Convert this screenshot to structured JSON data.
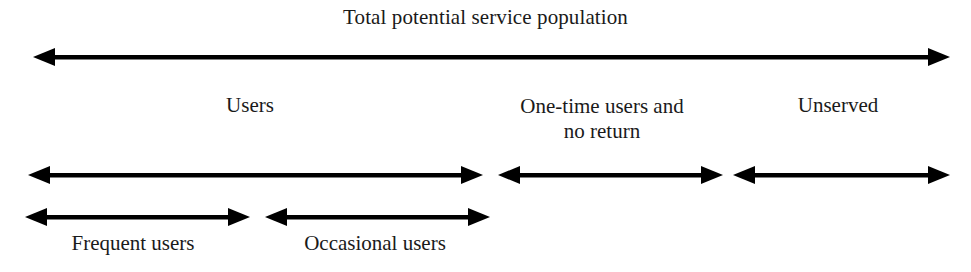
{
  "diagram": {
    "title": "Total potential service population",
    "background_color": "#ffffff",
    "stroke_color": "#000000",
    "text_color": "#1a1a1a",
    "total_arrow": {
      "label": "Total potential service population",
      "x_start": 33,
      "x_end": 950,
      "y": 57
    },
    "segments": [
      {
        "label": "Users",
        "x_start": 28,
        "x_end": 483,
        "y": 175,
        "label_x_center": 250,
        "label_y": 95,
        "lines": [
          "Users"
        ]
      },
      {
        "label": "One-time users and no return",
        "x_start": 498,
        "x_end": 723,
        "y": 175,
        "label_x_center": 602,
        "label_y": 95,
        "lines": [
          "One-time users and",
          "no return"
        ]
      },
      {
        "label": "Unserved",
        "x_start": 733,
        "x_end": 950,
        "y": 175,
        "label_x_center": 838,
        "label_y": 95,
        "lines": [
          "Unserved"
        ]
      }
    ],
    "subsegments": [
      {
        "label": "Frequent users",
        "x_start": 25,
        "x_end": 250,
        "y": 217,
        "label_x_center": 133,
        "label_y": 234
      },
      {
        "label": "Occasional users",
        "x_start": 265,
        "x_end": 490,
        "y": 217,
        "label_x_center": 375,
        "label_y": 234
      }
    ]
  }
}
